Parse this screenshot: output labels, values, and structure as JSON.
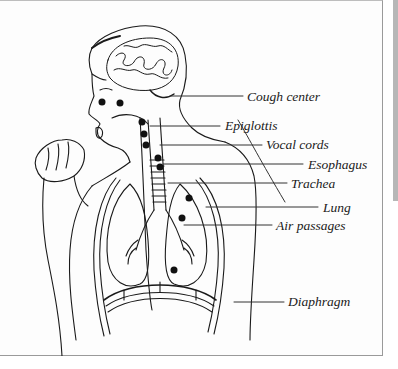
{
  "figure": {
    "labels": [
      {
        "id": "cough-center",
        "text": "Cough center"
      },
      {
        "id": "epiglottis",
        "text": "Epiglottis"
      },
      {
        "id": "vocal-cords",
        "text": "Vocal cords"
      },
      {
        "id": "esophagus",
        "text": "Esophagus"
      },
      {
        "id": "trachea",
        "text": "Trachea"
      },
      {
        "id": "lung",
        "text": "Lung"
      },
      {
        "id": "air-passages",
        "text": "Air passages"
      },
      {
        "id": "diaphragm",
        "text": "Diaphragm"
      }
    ]
  },
  "colors": {
    "ink": "#1a1a1a",
    "frame_border": "#9a9a9a",
    "side_strip": "#b7b7b7"
  }
}
